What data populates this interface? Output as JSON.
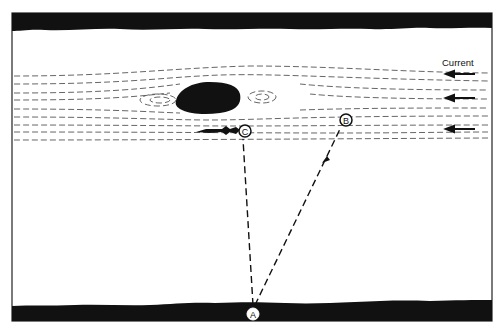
{
  "figure": {
    "legend_label": "Current",
    "current_direction": "right-to-left",
    "current_arrow_count": 3,
    "points": [
      {
        "id": "A",
        "label": "A",
        "role": "start on near bank"
      },
      {
        "id": "B",
        "label": "B",
        "role": "target upstream"
      },
      {
        "id": "C",
        "label": "C",
        "role": "behind obstacle (eddy)"
      }
    ],
    "paths": [
      {
        "from": "A",
        "to": "B",
        "style": "dashed",
        "arrowhead": true
      },
      {
        "from": "A",
        "to": "C",
        "style": "dashed",
        "arrowhead": false
      }
    ],
    "elements": [
      "top-bank",
      "bottom-bank",
      "rock-obstacle",
      "eddy-streamlines",
      "swimmer-at-C"
    ],
    "colors": {
      "ink": "#111111",
      "paper": "#ffffff",
      "streamline": "#555555"
    }
  }
}
